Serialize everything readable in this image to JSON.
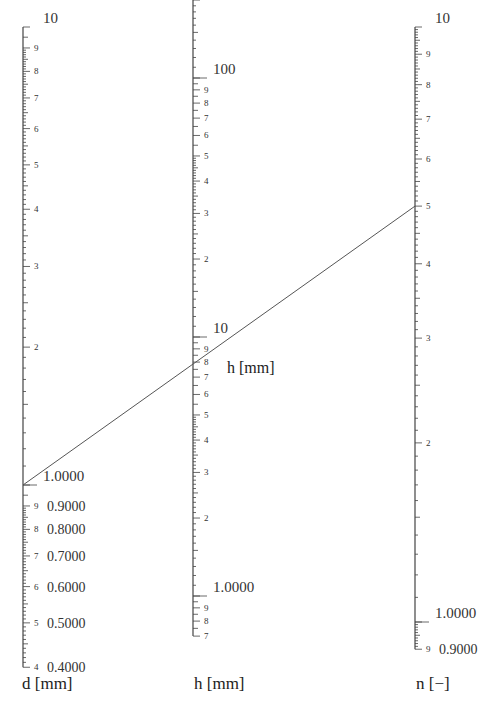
{
  "figure": {
    "type": "nomogram",
    "axes": [
      {
        "id": "d",
        "title": "d [mm]",
        "x": 23,
        "scale": "log",
        "decade_px": 458,
        "anchor": {
          "value": 1.0,
          "y": 485
        },
        "range": [
          0.4,
          10
        ],
        "major_labels": [
          {
            "value": 10,
            "text": "10",
            "big": true
          },
          {
            "value": 9,
            "text": "9"
          },
          {
            "value": 8,
            "text": "8"
          },
          {
            "value": 7,
            "text": "7"
          },
          {
            "value": 6,
            "text": "6"
          },
          {
            "value": 5,
            "text": "5"
          },
          {
            "value": 4,
            "text": "4"
          },
          {
            "value": 3,
            "text": "3"
          },
          {
            "value": 2,
            "text": "2"
          },
          {
            "value": 1.0,
            "text": "1.0000",
            "big": true
          },
          {
            "value": 0.9,
            "text": "9",
            "big_text": "0.9000"
          },
          {
            "value": 0.8,
            "text": "8",
            "big_text": "0.8000"
          },
          {
            "value": 0.7,
            "text": "7",
            "big_text": "0.7000"
          },
          {
            "value": 0.6,
            "text": "6",
            "big_text": "0.6000"
          },
          {
            "value": 0.5,
            "text": "5",
            "big_text": "0.5000"
          },
          {
            "value": 0.4,
            "text": "4",
            "big_text": "0.4000"
          }
        ]
      },
      {
        "id": "h",
        "title": "h [mm]",
        "inline_title": "h [mm]",
        "x": 193,
        "scale": "log",
        "decade_px": 259,
        "anchor": {
          "value": 10,
          "y": 337
        },
        "range": [
          0.7,
          300
        ],
        "major_labels": [
          {
            "value": 100,
            "text": "100",
            "big": true
          },
          {
            "value": 90,
            "text": "9"
          },
          {
            "value": 80,
            "text": "8"
          },
          {
            "value": 70,
            "text": "7"
          },
          {
            "value": 60,
            "text": "6"
          },
          {
            "value": 50,
            "text": "5"
          },
          {
            "value": 40,
            "text": "4"
          },
          {
            "value": 30,
            "text": "3"
          },
          {
            "value": 20,
            "text": "2"
          },
          {
            "value": 10,
            "text": "10",
            "big": true
          },
          {
            "value": 9,
            "text": "9"
          },
          {
            "value": 8,
            "text": "8"
          },
          {
            "value": 7,
            "text": "7"
          },
          {
            "value": 6,
            "text": "6"
          },
          {
            "value": 5,
            "text": "5"
          },
          {
            "value": 4,
            "text": "4"
          },
          {
            "value": 3,
            "text": "3"
          },
          {
            "value": 2,
            "text": "2"
          },
          {
            "value": 1.0,
            "text": "1.0000",
            "big": true
          },
          {
            "value": 0.9,
            "text": "9"
          },
          {
            "value": 0.8,
            "text": "8"
          },
          {
            "value": 0.7,
            "text": "7"
          }
        ]
      },
      {
        "id": "n",
        "title": "n [−]",
        "x": 415,
        "scale": "log",
        "decade_px": 595,
        "anchor": {
          "value": 1.0,
          "y": 622
        },
        "range": [
          0.9,
          10
        ],
        "major_labels": [
          {
            "value": 10,
            "text": "10",
            "big": true
          },
          {
            "value": 9,
            "text": "9"
          },
          {
            "value": 8,
            "text": "8"
          },
          {
            "value": 7,
            "text": "7"
          },
          {
            "value": 6,
            "text": "6"
          },
          {
            "value": 5,
            "text": "5"
          },
          {
            "value": 4,
            "text": "4"
          },
          {
            "value": 3,
            "text": "3"
          },
          {
            "value": 2,
            "text": "2"
          },
          {
            "value": 1.0,
            "text": "1.0000",
            "big": true
          },
          {
            "value": 0.9,
            "text": "9",
            "big_text": "0.9000"
          }
        ]
      }
    ],
    "isopleth": {
      "from": {
        "axis": "d",
        "value": 1.0
      },
      "to": {
        "axis": "n",
        "value": 5.0
      },
      "crosses": {
        "axis": "h",
        "value": 8.3
      }
    },
    "colors": {
      "line": "#555555",
      "axis": "#444444",
      "text": "#333333"
    }
  },
  "labels": {
    "d_title": "d [mm]",
    "h_title": "h [mm]",
    "n_title": "n [−]",
    "h_inline": "h [mm]"
  }
}
